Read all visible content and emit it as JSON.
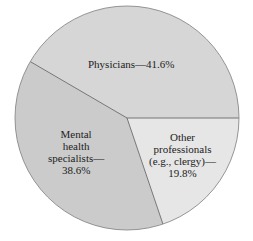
{
  "chart_data": {
    "type": "pie",
    "title": "",
    "categories": [
      "Physicians",
      "Mental health specialists",
      "Other professionals (e.g., clergy)"
    ],
    "values": [
      41.6,
      38.6,
      19.8
    ],
    "unit": "%",
    "labels": [
      {
        "lines": [
          "Physicians—41.6%"
        ]
      },
      {
        "lines": [
          "Mental",
          "health",
          "specialists—",
          "38.6%"
        ]
      },
      {
        "lines": [
          "Other",
          "professionals",
          "(e.g., clergy)—",
          "19.8%"
        ]
      }
    ],
    "colors": [
      "#d6d6d6",
      "#cbcbcb",
      "#e6e6e6"
    ],
    "legend": "none (direct labels)"
  }
}
